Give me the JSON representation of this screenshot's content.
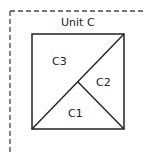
{
  "diagram": {
    "title": "Unit C",
    "pieces": [
      {
        "id": "c1",
        "label": "C1"
      },
      {
        "id": "c2",
        "label": "C2"
      },
      {
        "id": "c3",
        "label": "C3"
      }
    ],
    "colors": {
      "line": "#222222",
      "dash": "#444444",
      "background": "#ffffff"
    }
  }
}
